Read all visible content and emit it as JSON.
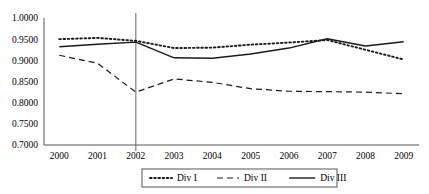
{
  "chart_data": {
    "type": "line",
    "title": "",
    "subtitle": "",
    "xlabel": "",
    "ylabel": "",
    "x": [
      2000,
      2001,
      2002,
      2003,
      2004,
      2005,
      2006,
      2007,
      2008,
      2009
    ],
    "categories": [
      "2000",
      "2001",
      "2002",
      "2003",
      "2004",
      "2005",
      "2006",
      "2007",
      "2008",
      "2009"
    ],
    "xlim": [
      1999.6,
      2009.4
    ],
    "ylim": [
      0.7,
      1.0
    ],
    "yticks": [
      0.7,
      0.75,
      0.8,
      0.85,
      0.9,
      0.95,
      1.0
    ],
    "ytick_labels": [
      "0.7000",
      "0.7500",
      "0.8000",
      "0.8500",
      "0.9000",
      "0.9500",
      "1.0000"
    ],
    "grid": false,
    "legend_position": "bottom",
    "annotations": [
      {
        "type": "vline",
        "x": 2002,
        "label": ""
      }
    ],
    "series": [
      {
        "name": "Div I",
        "style": "dotted",
        "color": "#1a1a1a",
        "values": [
          0.95,
          0.953,
          0.946,
          0.929,
          0.93,
          0.937,
          0.942,
          0.948,
          0.925,
          0.902
        ]
      },
      {
        "name": "Div II",
        "style": "dashed",
        "color": "#1a1a1a",
        "values": [
          0.912,
          0.893,
          0.825,
          0.856,
          0.848,
          0.833,
          0.827,
          0.826,
          0.825,
          0.821
        ]
      },
      {
        "name": "Div III",
        "style": "solid",
        "color": "#1a1a1a",
        "values": [
          0.932,
          0.938,
          0.943,
          0.906,
          0.905,
          0.915,
          0.929,
          0.951,
          0.934,
          0.944
        ]
      }
    ]
  },
  "legend": {
    "items": [
      {
        "label": "Div I",
        "style": "dotted"
      },
      {
        "label": "Div II",
        "style": "dashed"
      },
      {
        "label": "Div III",
        "style": "solid"
      }
    ]
  }
}
